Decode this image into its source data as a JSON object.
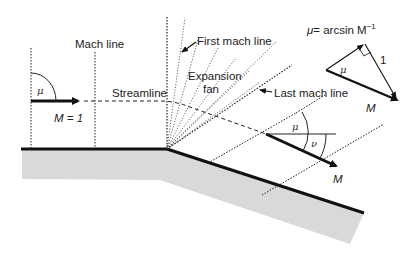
{
  "diagram": {
    "labels": {
      "mach_line": "Mach line",
      "streamline": "Streamline",
      "first_mach_line": "First mach line",
      "expansion_fan_line1": "Expansion",
      "expansion_fan_line2": "fan",
      "last_mach_line": "Last mach line",
      "inflow_mach": "M = 1",
      "outflow_mach": "M",
      "mu_left": "μ",
      "mu_right": "μ",
      "nu": "ν",
      "formula_mu": "μ",
      "formula_rest": "= arcsin M",
      "formula_exp": "−1",
      "triangle_mu": "μ",
      "triangle_side": "1",
      "triangle_M": "M"
    },
    "colors": {
      "wall": "#111111",
      "wall_fill": "#d9d9d9",
      "lines": "#222222",
      "background": "#ffffff"
    },
    "geometry": {
      "corner": [
        167,
        149
      ],
      "upstream_wall_start": [
        21,
        149
      ],
      "downstream_wall_end": [
        364,
        213
      ],
      "mach_lines_x": [
        31,
        95
      ],
      "fan_line_count": 7
    }
  }
}
